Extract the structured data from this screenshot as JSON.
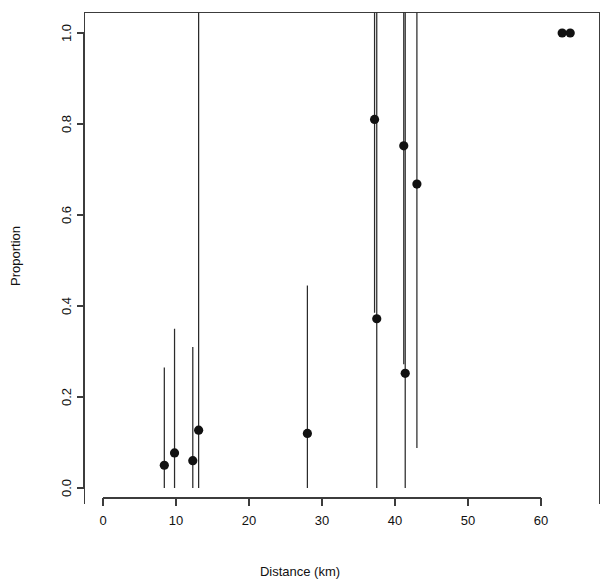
{
  "chart_data": {
    "type": "scatter",
    "title": "",
    "xlabel": "Distance (km)",
    "ylabel": "Proportion",
    "xlim": [
      -2.5,
      68.0
    ],
    "ylim": [
      -0.035,
      1.045
    ],
    "xticks": [
      0,
      10,
      20,
      30,
      40,
      50,
      60
    ],
    "xticklabels": [
      "0",
      "10",
      "20",
      "30",
      "40",
      "50",
      "60"
    ],
    "yticks": [
      0.0,
      0.2,
      0.4,
      0.6,
      0.8,
      1.0
    ],
    "yticklabels": [
      "0.0",
      "0.2",
      "0.4",
      "0.6",
      "0.8",
      "1.0"
    ],
    "grid": false,
    "legend": null,
    "marker": "filled-circle",
    "marker_color": "#111111",
    "errorbar_color": "#2b2b2b",
    "errorbar_style": "vertical-line-no-caps",
    "points": [
      {
        "x": 8.4,
        "y": 0.05,
        "ylow": 0.0,
        "yhigh": 0.265
      },
      {
        "x": 9.8,
        "y": 0.077,
        "ylow": 0.0,
        "yhigh": 0.35
      },
      {
        "x": 12.3,
        "y": 0.06,
        "ylow": 0.0,
        "yhigh": 0.31
      },
      {
        "x": 13.1,
        "y": 0.127,
        "ylow": 0.0,
        "yhigh": 1.045
      },
      {
        "x": 28.0,
        "y": 0.12,
        "ylow": 0.0,
        "yhigh": 0.445
      },
      {
        "x": 37.2,
        "y": 0.81,
        "ylow": 0.385,
        "yhigh": 1.045
      },
      {
        "x": 37.5,
        "y": 0.372,
        "ylow": 0.0,
        "yhigh": 1.045
      },
      {
        "x": 41.2,
        "y": 0.752,
        "ylow": 0.272,
        "yhigh": 1.045
      },
      {
        "x": 41.4,
        "y": 0.252,
        "ylow": 0.0,
        "yhigh": 1.045
      },
      {
        "x": 43.0,
        "y": 0.668,
        "ylow": 0.088,
        "yhigh": 1.045
      },
      {
        "x": 62.9,
        "y": 1.0,
        "ylow": 1.0,
        "yhigh": 1.0
      },
      {
        "x": 64.0,
        "y": 1.0,
        "ylow": 1.0,
        "yhigh": 1.0
      }
    ]
  },
  "figure": {
    "background_color": "#ffffff",
    "axis_color": "#3c3c3c"
  }
}
